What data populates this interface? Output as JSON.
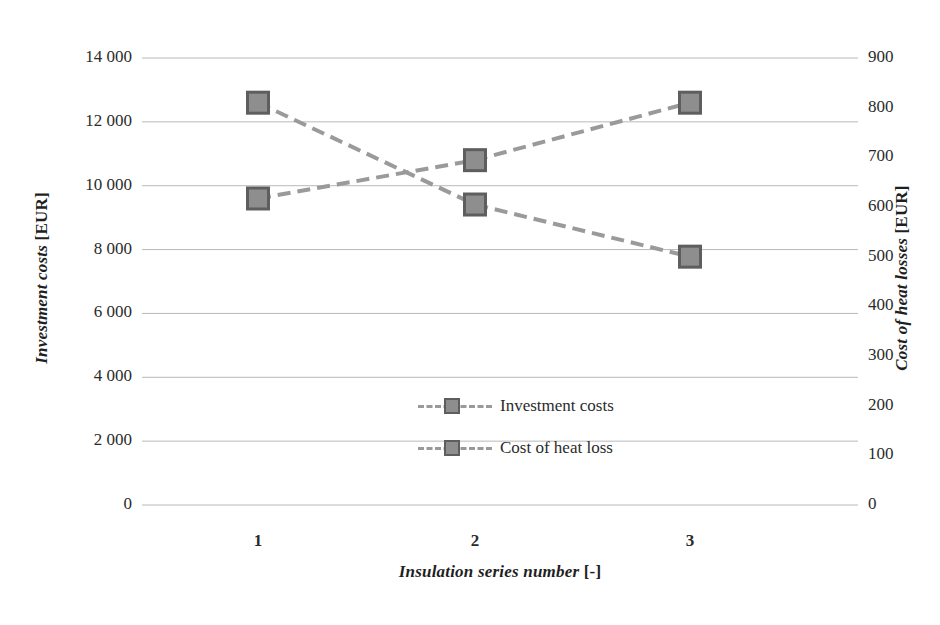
{
  "chart_data": {
    "type": "line",
    "title": "",
    "xlabel": "Insulation series number",
    "xlabel_unit": "[-]",
    "categories": [
      "1",
      "2",
      "3"
    ],
    "grid": true,
    "legend_position": "center",
    "axes": {
      "left": {
        "label": "Investment costs",
        "unit": "[EUR]",
        "ticks": [
          "14 000",
          "12 000",
          "10 000",
          "8 000",
          "6 000",
          "4 000",
          "2 000",
          "0"
        ],
        "tick_values": [
          14000,
          12000,
          10000,
          8000,
          6000,
          4000,
          2000,
          0
        ],
        "ylim": [
          0,
          14000
        ]
      },
      "right": {
        "label": "Cost of heat losses",
        "unit": "[EUR]",
        "ticks": [
          "900",
          "800",
          "700",
          "600",
          "500",
          "400",
          "300",
          "200",
          "100",
          "0"
        ],
        "tick_values": [
          900,
          800,
          700,
          600,
          500,
          400,
          300,
          200,
          100,
          0
        ],
        "ylim": [
          0,
          900
        ]
      }
    },
    "series": [
      {
        "name": "Investment costs",
        "axis": "left",
        "values": [
          9600,
          10800,
          12600
        ],
        "color": "#9a9a9a",
        "marker": "square",
        "linestyle": "dashed"
      },
      {
        "name": "Cost of heat loss",
        "axis": "right",
        "values": [
          810,
          605,
          500
        ],
        "color": "#9a9a9a",
        "marker": "square",
        "linestyle": "dashed"
      }
    ]
  },
  "legend": {
    "items": [
      {
        "label": "Investment costs"
      },
      {
        "label": "Cost of heat loss"
      }
    ]
  },
  "colors": {
    "series_line": "#9a9a9a",
    "marker_fill": "#8e8e8e",
    "marker_stroke": "#5e5e5e",
    "gridline": "#b9b9b9",
    "text": "#2b2b2b"
  }
}
